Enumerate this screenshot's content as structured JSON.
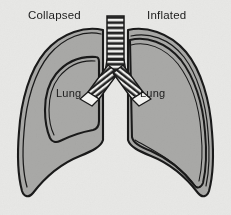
{
  "figure": {
    "kind": "anatomical-diagram",
    "background_color": "#e8e8e6",
    "tissue_fill_color": "#a9a9a7",
    "outline_color": "#1a1a1a",
    "airway_fill_color": "#f2f2f0",
    "label_color": "#1c1c1c",
    "width": 231,
    "height": 215
  },
  "labels": {
    "left_title": "Collapsed",
    "right_title": "Inflated",
    "left_organ": "Lung",
    "right_organ": "Lung"
  },
  "parts": {
    "trachea": {
      "name": "trachea",
      "cartilage_ring_count": 12
    },
    "left_bronchus": {
      "name": "left-bronchus",
      "cartilage_ring_count": 7
    },
    "right_bronchus": {
      "name": "right-bronchus",
      "cartilage_ring_count": 7
    },
    "left_chest_cavity": {
      "name": "left-chest-cavity",
      "state": "Collapsed"
    },
    "right_chest_cavity": {
      "name": "right-chest-cavity",
      "state": "Inflated"
    }
  }
}
